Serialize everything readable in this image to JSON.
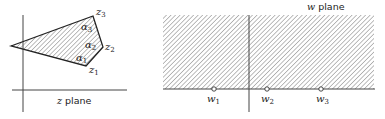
{
  "z_plane": {
    "label_var": "z",
    "label_word": "plane",
    "vertices": [
      {
        "name": "z",
        "sub": "1"
      },
      {
        "name": "z",
        "sub": "2"
      },
      {
        "name": "z",
        "sub": "3"
      }
    ],
    "angles": [
      {
        "name": "α",
        "sub": "1"
      },
      {
        "name": "α",
        "sub": "2"
      },
      {
        "name": "α",
        "sub": "3"
      }
    ]
  },
  "w_plane": {
    "label_var": "w",
    "label_word": "plane",
    "points": [
      {
        "name": "w",
        "sub": "1"
      },
      {
        "name": "w",
        "sub": "2"
      },
      {
        "name": "w",
        "sub": "3"
      }
    ]
  }
}
